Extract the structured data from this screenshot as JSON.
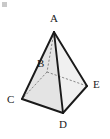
{
  "figure": {
    "background_color": "#ffffff",
    "stroke_color": "#1a1a1a",
    "hidden_stroke_color": "#6e6e6e",
    "face_fill_light": "#f2f2f2",
    "face_fill_mid": "#e8e8e8",
    "face_fill_base": "#ededed",
    "width": 110,
    "height": 139
  },
  "vertices": [
    {
      "id": "A",
      "label": "A",
      "x": 54,
      "y": 32,
      "label_x": 50,
      "label_y": 13,
      "role": "apex",
      "hidden": false
    },
    {
      "id": "B",
      "label": "B",
      "x": 47,
      "y": 72,
      "label_x": 37,
      "label_y": 58,
      "role": "base-back",
      "hidden": true
    },
    {
      "id": "C",
      "label": "C",
      "x": 22,
      "y": 99,
      "label_x": 8,
      "label_y": 94,
      "role": "base-left",
      "hidden": false
    },
    {
      "id": "D",
      "label": "D",
      "x": 63,
      "y": 113,
      "label_x": 59,
      "label_y": 119,
      "role": "base-front",
      "hidden": false
    },
    {
      "id": "E",
      "label": "E",
      "x": 87,
      "y": 86,
      "label_x": 93,
      "label_y": 79,
      "role": "base-right",
      "hidden": false
    }
  ],
  "edges": [
    {
      "from": "A",
      "to": "C",
      "style": "solid"
    },
    {
      "from": "A",
      "to": "D",
      "style": "solid"
    },
    {
      "from": "A",
      "to": "E",
      "style": "solid"
    },
    {
      "from": "C",
      "to": "D",
      "style": "solid"
    },
    {
      "from": "D",
      "to": "E",
      "style": "solid"
    },
    {
      "from": "A",
      "to": "B",
      "style": "dashed"
    },
    {
      "from": "B",
      "to": "C",
      "style": "dashed"
    },
    {
      "from": "B",
      "to": "E",
      "style": "dashed"
    }
  ],
  "faces": [
    {
      "id": "face-ACD",
      "vertices": "A,C,D",
      "fill": "#e6e6e6"
    },
    {
      "id": "face-ADE",
      "vertices": "A,D,E",
      "fill": "#efefef"
    },
    {
      "id": "face-base",
      "vertices": "C,B,E,D",
      "fill": "#ebebeb"
    }
  ],
  "artifacts": {
    "corner_speck_color": "#c9c9c9"
  }
}
